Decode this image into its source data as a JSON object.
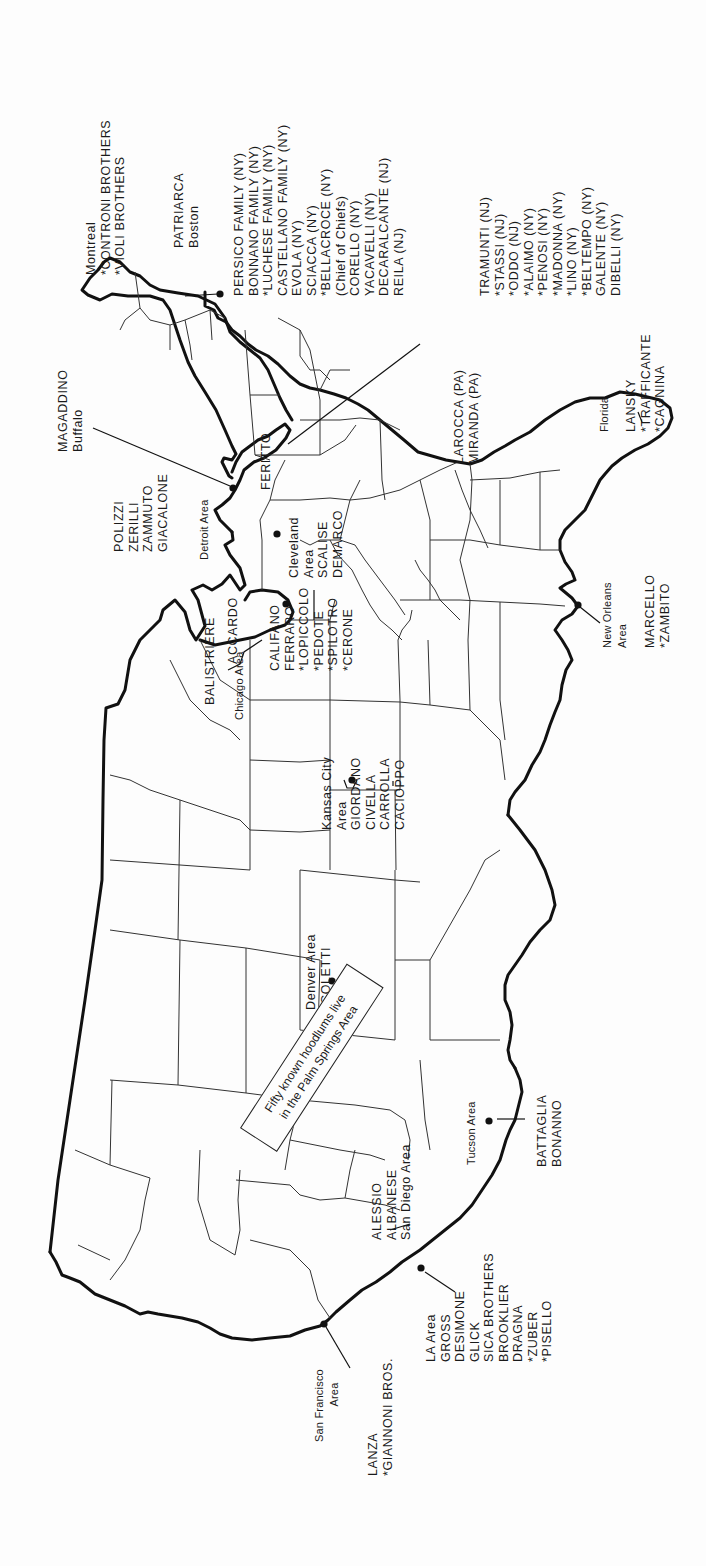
{
  "map": {
    "orientation": "rotated 90 degrees; north at left, east at top",
    "callout": {
      "line1": "Fifty known hoodlums live",
      "line2": "in the Palm Springs Area"
    },
    "regions": [
      {
        "id": "montreal",
        "place": "Montreal",
        "names": [
          "*CONTRONI BROTHERS",
          "*VIOLI BROTHERS"
        ]
      },
      {
        "id": "boston",
        "place": "Boston",
        "names": [
          "PATRIARCA"
        ]
      },
      {
        "id": "new-york-new-jersey",
        "names": [
          "PERSICO FAMILY (NY)",
          "BONNANO FAMILY (NY)",
          "*LUCHESE FAMILY (NY)",
          "CASTELLANO FAMILY (NY)",
          "EVOLA (NY)",
          "SCIACCA (NY)",
          "*BELLACROCE (NY)",
          "(Chief of Chiefs)",
          "CORELLO (NY)",
          "YACAVELLI (NY)",
          "DECARALCANTE (NJ)",
          "REILA (NJ)"
        ]
      },
      {
        "id": "new-york-new-jersey-2",
        "names": [
          "TRAMUNTI (NJ)",
          "*STASSI (NJ)",
          "*ODDO (NJ)",
          "*ALAIMO (NY)",
          "*PENOSI (NY)",
          "*MADONNA (NY)",
          "*LINO (NY)",
          "*BELTEMPO (NY)",
          "GALENTE (NY)",
          "DIBELLI (NY)"
        ]
      },
      {
        "id": "buffalo",
        "place": "Buffalo",
        "names": [
          "MAGADDINO"
        ]
      },
      {
        "id": "detroit",
        "place": "Detroit Area",
        "names": [
          "POLIZZI",
          "ZERILLI",
          "ZAMMUTO",
          "GIACALONE"
        ]
      },
      {
        "id": "pennsylvania",
        "names": [
          "FERITTO"
        ]
      },
      {
        "id": "pennsylvania-2",
        "names": [
          "LAROCCA (PA)",
          "MIRANDA (PA)"
        ]
      },
      {
        "id": "cleveland",
        "place": "Cleveland Area",
        "names": [
          "SCALISE",
          "DEMARCO"
        ]
      },
      {
        "id": "florida",
        "place": "Florida",
        "names": [
          "LANSKY",
          "*TRAFFICANTE",
          "*CAGNINA"
        ]
      },
      {
        "id": "chicago",
        "place": "Chicago Area",
        "names": [
          "BALISTRIERE",
          "ACCARDO",
          "CALIFANO",
          "FERRARO",
          "*LOPICCOLO",
          "*PEDOTE",
          "*SPILOTRO",
          "*CERONE"
        ]
      },
      {
        "id": "kansas-city",
        "place": "Kansas City Area",
        "names": [
          "GIORDANO",
          "CIVELLA",
          "CARROLLA",
          "CACIOPPO"
        ]
      },
      {
        "id": "new-orleans",
        "place": "New Orleans Area",
        "names": [
          "MARCELLO",
          "*ZAMBITO"
        ]
      },
      {
        "id": "denver",
        "place": "Denver Area",
        "names": [
          "COLETTI"
        ]
      },
      {
        "id": "tucson",
        "place": "Tucson Area",
        "names": [
          "BATTAGLIA",
          "BONANNO"
        ]
      },
      {
        "id": "san-diego",
        "place": "San Diego Area",
        "names": [
          "ALESSIO",
          "ALBANESE"
        ]
      },
      {
        "id": "los-angeles",
        "place": "LA Area",
        "names": [
          "GROSS",
          "DESIMONE",
          "GLICK",
          "SICA BROTHERS",
          "BROOKLIER",
          "DRAGNA",
          "*ZUBER",
          "*PISELLO"
        ]
      },
      {
        "id": "san-francisco",
        "place": "San Francisco Area",
        "names": [
          "LANZA",
          "*GIANNONI BROS."
        ]
      }
    ]
  },
  "labels": {
    "montreal": {
      "l1": "Montreal",
      "l2": "*CONTRONI BROTHERS",
      "l3": "*VIOLI BROTHERS"
    },
    "boston": {
      "l1": "PATRIARCA",
      "l2": "Boston"
    },
    "ny1": {
      "l1": "PERSICO FAMILY (NY)",
      "l2": "BONNANO FAMILY (NY)",
      "l3": "*LUCHESE FAMILY (NY)",
      "l4": "CASTELLANO FAMILY (NY)",
      "l5": "EVOLA (NY)",
      "l6": "SCIACCA (NY)",
      "l7": "*BELLACROCE (NY)",
      "l8": "(Chief of Chiefs)",
      "l9": "CORELLO (NY)",
      "l10": "YACAVELLI (NY)",
      "l11": "DECARALCANTE (NJ)",
      "l12": "REILA (NJ)"
    },
    "ny2": {
      "l1": "TRAMUNTI (NJ)",
      "l2": "*STASSI (NJ)",
      "l3": "*ODDO (NJ)",
      "l4": "*ALAIMO (NY)",
      "l5": "*PENOSI (NY)",
      "l6": "*MADONNA (NY)",
      "l7": "*LINO (NY)",
      "l8": "*BELTEMPO (NY)",
      "l9": "GALENTE (NY)",
      "l10": "DIBELLI (NY)"
    },
    "buffalo": {
      "l1": "MAGADDINO",
      "l2": "Buffalo"
    },
    "detroit_names": {
      "l1": "POLIZZI",
      "l2": "ZERILLI",
      "l3": "ZAMMUTO",
      "l4": "GIACALONE"
    },
    "detroit_place": "Detroit Area",
    "feritto": "FERITTO",
    "pa": {
      "l1": "LAROCCA (PA)",
      "l2": "MIRANDA (PA)"
    },
    "cleveland": {
      "l1": "Cleveland",
      "l2": "Area",
      "l3": "SCALISE",
      "l4": "DEMARCO"
    },
    "florida_place": "Florida",
    "florida": {
      "l1": "LANSKY",
      "l2": "*TRAFFICANTE",
      "l3": "*CAGNINA"
    },
    "balistriere": "BALISTRIERE",
    "chicago_place": "Chicago Area",
    "accardo": "ACCARDO",
    "chicago": {
      "l1": "CALIFANO",
      "l2": "FERRARO",
      "l3": "*LOPICCOLO",
      "l4": "*PEDOTE",
      "l5": "*SPILOTRO",
      "l6": "*CERONE"
    },
    "kc": {
      "l1": "Kansas City",
      "l2": "Area",
      "l3": "GIORDANO",
      "l4": "CIVELLA",
      "l5": "CARROLLA",
      "l6": "CACIOPPO"
    },
    "no": {
      "l1": "New Orleans",
      "l2": "Area"
    },
    "no_names": {
      "l1": "MARCELLO",
      "l2": "*ZAMBITO"
    },
    "denver": {
      "l1": "Denver Area",
      "l2": "COLETTI"
    },
    "tucson_place": "Tucson Area",
    "tucson": {
      "l1": "BATTAGLIA",
      "l2": "BONANNO"
    },
    "sd": {
      "l1": "ALESSIO",
      "l2": "ALBANESE",
      "l3": "San Diego Area"
    },
    "la": {
      "l1": "LA Area",
      "l2": "GROSS",
      "l3": "DESIMONE",
      "l4": "GLICK",
      "l5": "SICA BROTHERS",
      "l6": "BROOKLIER",
      "l7": "DRAGNA",
      "l8": "*ZUBER",
      "l9": "*PISELLO"
    },
    "sf": {
      "l1": "San Francisco",
      "l2": "Area"
    },
    "sf_names": {
      "l1": "LANZA",
      "l2": "*GIANNONI BROS."
    }
  }
}
